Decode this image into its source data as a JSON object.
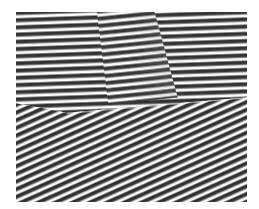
{
  "image": {
    "description": "Grayscale fringe/stripe pattern with two domains: near-horizontal stripes in the upper region and diagonal stripes descending to the right in the lower region, separated by an irregular boundary",
    "colors": {
      "dark_stripe": "#2e2e2e",
      "light_stripe": "#ffffff",
      "background": "#ffffff"
    },
    "regions": [
      {
        "name": "upper-domain",
        "orientation": "near-horizontal"
      },
      {
        "name": "lower-domain",
        "orientation": "diagonal"
      }
    ]
  }
}
